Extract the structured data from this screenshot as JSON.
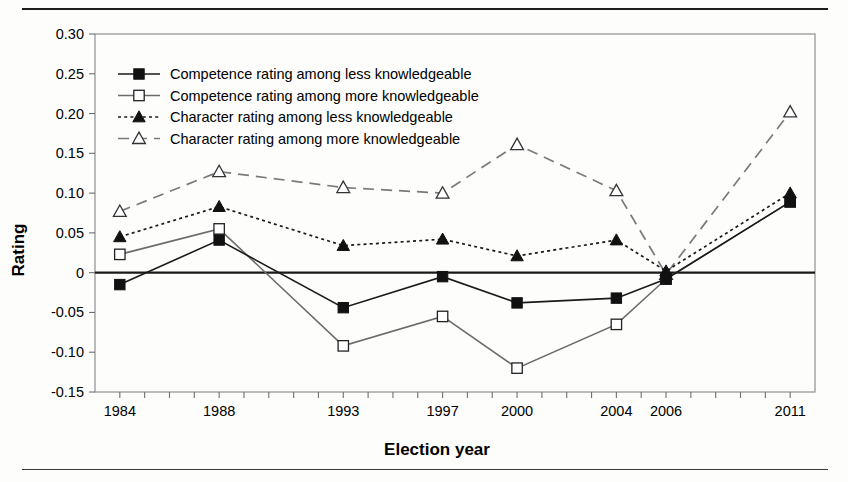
{
  "figure": {
    "has_top_rule": true,
    "has_bottom_rule": true,
    "frame_color": "#8a8a8a",
    "background": "#fdfdfc"
  },
  "chart_data": {
    "type": "line",
    "title": "",
    "xlabel": "Election year",
    "ylabel": "Rating",
    "x": [
      1984,
      1988,
      1993,
      1997,
      2000,
      2004,
      2006,
      2011
    ],
    "categories": [
      "1984",
      "1988",
      "1993",
      "1997",
      "2000",
      "2004",
      "2006",
      "2011"
    ],
    "xlim": [
      1983,
      2012
    ],
    "ylim": [
      -0.15,
      0.3
    ],
    "xtick_labels": [
      "1984",
      "1988",
      "1993",
      "1997",
      "2000",
      "2004",
      "2006",
      "2011"
    ],
    "ytick_labels": [
      "0.30",
      "0.25",
      "0.20",
      "0.15",
      "0.10",
      "0.05",
      "0",
      "-0.05",
      "-0.10",
      "-0.15"
    ],
    "ytick_values": [
      0.3,
      0.25,
      0.2,
      0.15,
      0.1,
      0.05,
      0,
      -0.05,
      -0.1,
      -0.15
    ],
    "grid": false,
    "zero_line": true,
    "legend_position": "top-left",
    "series": [
      {
        "name": "Competence rating among less knowledgeable",
        "marker": "filled-square",
        "line_style": "solid",
        "color": "#1a1a1a",
        "values": [
          -0.015,
          0.041,
          -0.044,
          -0.005,
          -0.038,
          -0.032,
          -0.008,
          0.089
        ]
      },
      {
        "name": "Competence rating among more knowledgeable",
        "marker": "open-square",
        "line_style": "solid",
        "color": "#6b6b6b",
        "values": [
          0.023,
          0.055,
          -0.092,
          -0.055,
          -0.12,
          -0.065,
          -0.008,
          0.089
        ]
      },
      {
        "name": "Character rating among less knowledgeable",
        "marker": "filled-triangle",
        "line_style": "dotted",
        "color": "#1a1a1a",
        "values": [
          0.045,
          0.083,
          0.034,
          0.042,
          0.021,
          0.041,
          0.002,
          0.1
        ]
      },
      {
        "name": "Character rating among more knowledgeable",
        "marker": "open-triangle",
        "line_style": "dashed",
        "color": "#7a7a7a",
        "values": [
          0.077,
          0.127,
          0.107,
          0.1,
          0.161,
          0.103,
          -0.002,
          0.202
        ]
      }
    ]
  },
  "legend": {
    "entries": [
      "Competence rating among less knowledgeable",
      "Competence rating among more knowledgeable",
      "Character rating among less knowledgeable",
      "Character rating among more knowledgeable"
    ]
  }
}
